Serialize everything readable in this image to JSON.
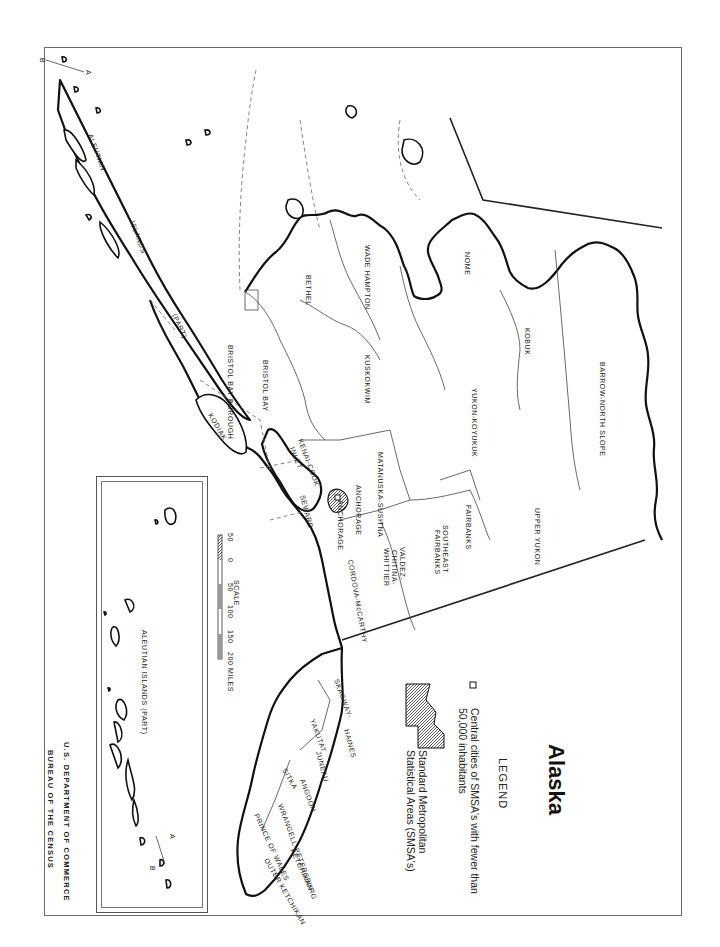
{
  "document": {
    "orientation": "rotated 90 degrees clockwise",
    "title": "Alaska",
    "legend": {
      "heading": "LEGEND",
      "items": [
        {
          "symbol": "open-square",
          "text_line1": "Central cities of SMSA's with fewer than",
          "text_line2": "50,000 inhabitants"
        },
        {
          "symbol": "hatched-area",
          "text_line1": "Standard Metropolitan",
          "text_line2": "Statistical Areas (SMSA's)"
        }
      ]
    },
    "agency": {
      "line1": "U.S. DEPARTMENT OF COMMERCE",
      "line2": "BUREAU OF THE CENSUS"
    },
    "scale": {
      "title": "SCALE",
      "ticks": [
        "50",
        "0",
        "50",
        "100",
        "150",
        "200 MILES"
      ]
    },
    "inset": {
      "label": "ALEUTIAN ISLANDS (PART)",
      "marker_a": "A",
      "marker_b": "B"
    },
    "section_markers": {
      "a": "A",
      "b": "B"
    },
    "regions": {
      "aleutian": "ALEUTIAN",
      "islands": "ISLANDS",
      "part": "(PART)",
      "bristol_bay_borough": "BRISTOL BAY BOROUGH",
      "bristol_bay": "BRISTOL BAY",
      "bethel": "BETHEL",
      "wade_hampton": "WADE HAMPTON",
      "nome": "NOME",
      "kobuk": "KOBUK",
      "barrow": "BARROW-NORTH SLOPE",
      "kuskokwim": "KUSKOKWIM",
      "yukon_koyukuk": "YUKON-KOYUKUK",
      "upper_yukon": "UPPER YUKON",
      "fairbanks": "FAIRBANKS",
      "se_fairbanks": "SOUTHEAST FAIRBANKS",
      "matanuska": "MATANUSKA-SUSITNA",
      "anchorage": "ANCHORAGE",
      "anchorage_city": "ANCHORAGE",
      "kenai": "KENAI-COOK INLET",
      "kodiak": "KODIAK",
      "seward": "SEWARD",
      "valdez": "VALDEZ-CHITINA-WHITTIER",
      "cordova": "CORDOVA-McCARTHY",
      "skagway": "SKAGWAY-YAKUTAT",
      "haines": "HAINES",
      "juneau": "JUNEAU",
      "sitka": "SITKA",
      "angoon": "ANGOON",
      "wrangell": "WRANGELL-PETERSBURG",
      "prince_of_wales": "PRINCE OF WALES",
      "outer_ketchikan": "OUTER KETCHIKAN",
      "ketchikan": "KETCHIKAN"
    }
  }
}
